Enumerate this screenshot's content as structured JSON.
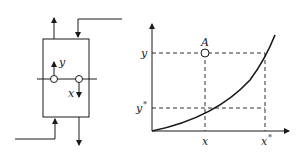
{
  "left_diagram": {
    "title": "Countercurrent contactor schematic",
    "labels": {
      "gas_composition": "y",
      "liquid_composition": "x"
    }
  },
  "right_diagram": {
    "title": "Equilibrium curve with operating point",
    "point_label": "A",
    "y_axis_ticks": [
      "y",
      "y*"
    ],
    "x_axis_ticks": [
      "x",
      "x*"
    ],
    "y_label": "y",
    "y_star_label": "y",
    "y_star_sup": "*",
    "x_label": "x",
    "x_star_label": "x",
    "x_star_sup": "*"
  },
  "colors": {
    "stroke": "#1a1a1a",
    "background": "#ffffff"
  }
}
